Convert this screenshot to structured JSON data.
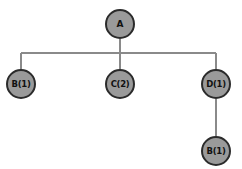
{
  "caption": {
    "text": "",
    "visible_fragment": ""
  },
  "diagram": {
    "type": "tree",
    "background_color": "#ffffff",
    "node_fill_color": "#9a9a9a",
    "node_border_color": "#2b2b2b",
    "edge_color": "#8a8a8a",
    "label_color": "#111111",
    "nodes": [
      {
        "id": "root",
        "label": "A",
        "cx": 120,
        "cy": 24,
        "r": 15
      },
      {
        "id": "b1",
        "label": "B(1)",
        "cx": 21,
        "cy": 84,
        "r": 15
      },
      {
        "id": "c2",
        "label": "C(2)",
        "cx": 120,
        "cy": 84,
        "r": 15
      },
      {
        "id": "d1",
        "label": "D(1)",
        "cx": 216,
        "cy": 84,
        "r": 15
      },
      {
        "id": "b1sub",
        "label": "B(1)",
        "cx": 216,
        "cy": 151,
        "r": 15
      }
    ],
    "edges": [
      {
        "from": "root",
        "to": "b1"
      },
      {
        "from": "root",
        "to": "c2"
      },
      {
        "from": "root",
        "to": "d1"
      },
      {
        "from": "d1",
        "to": "b1sub"
      }
    ],
    "bus_y": 53,
    "bus_x_start": 21,
    "bus_x_end": 216,
    "line_width": 2
  }
}
